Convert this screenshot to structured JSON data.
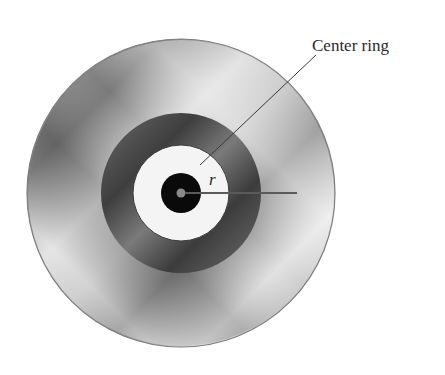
{
  "figure": {
    "labels": {
      "center_ring": "Center ring",
      "radius": "r"
    },
    "geometry": {
      "center": [
        181,
        193
      ],
      "outer_radius": 154,
      "dark_ring_radius": 80,
      "center_ring_radius": 48,
      "hub_radius": 20,
      "spindle_dot_radius": 4,
      "radius_line_end": [
        297,
        193
      ],
      "leader_line": [
        [
          200,
          165
        ],
        [
          316,
          55
        ]
      ]
    },
    "colors": {
      "background": "#ffffff",
      "disc_light": "#e6e6e6",
      "disc_dark": "#6e6e6e",
      "dark_ring": "#555555",
      "center_ring": "#f4f4f4",
      "hub": "#0a0a0a",
      "spindle_dot": "#8a8a8a",
      "line": "#4a4a4a"
    }
  }
}
